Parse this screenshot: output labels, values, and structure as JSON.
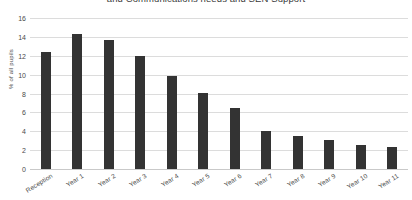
{
  "chart_data": {
    "type": "bar",
    "title": "and Communications needs and SEN Support",
    "xlabel": "",
    "ylabel": "% of all pupils",
    "ylim": [
      0,
      16
    ],
    "ytick_step": 2,
    "yticks": [
      16,
      14,
      12,
      10,
      8,
      6,
      4,
      2,
      0
    ],
    "grid": true,
    "legend": "none",
    "bar_color": "#333333",
    "gridline_color": "#dcdcdc",
    "categories": [
      "Reception",
      "Year 1",
      "Year 2",
      "Year 3",
      "Year 4",
      "Year 5",
      "Year 6",
      "Year 7",
      "Year 8",
      "Year 9",
      "Year 10",
      "Year 11"
    ],
    "values": [
      12.4,
      14.3,
      13.7,
      12.0,
      9.9,
      8.1,
      6.5,
      4.0,
      3.5,
      3.1,
      2.5,
      2.3
    ]
  }
}
